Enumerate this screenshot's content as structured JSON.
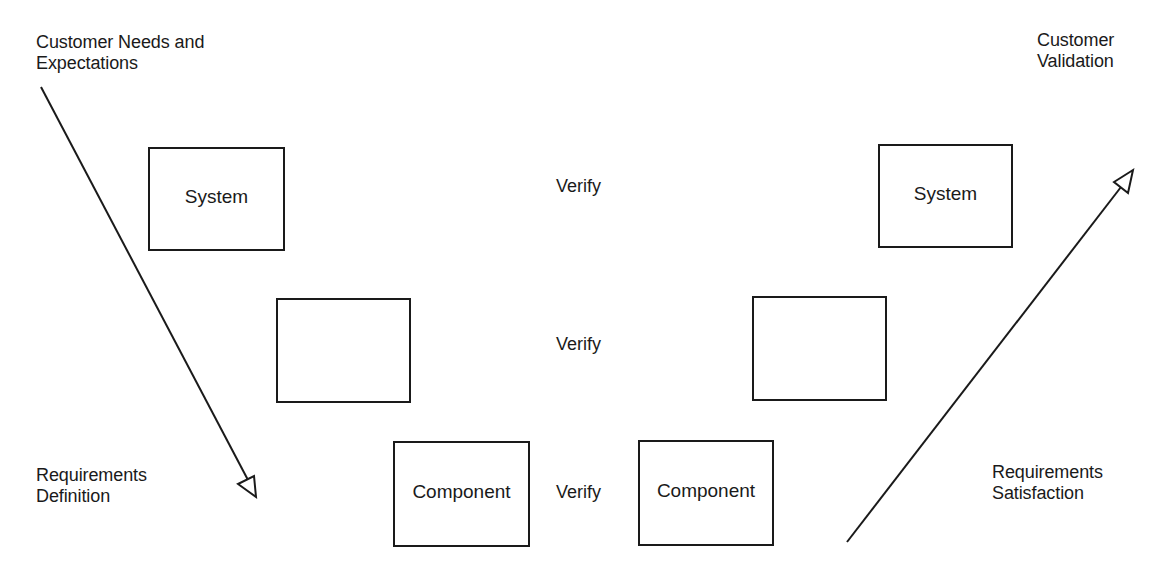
{
  "diagram": {
    "type": "V-model",
    "left_side": {
      "top_label": [
        "Customer Needs and",
        "Expectations"
      ],
      "bottom_label": [
        "Requirements",
        "Definition"
      ],
      "arrow_direction": "down-right",
      "boxes": [
        {
          "label": "System"
        },
        {
          "label": ""
        },
        {
          "label": "Component"
        }
      ]
    },
    "right_side": {
      "top_label": [
        "Customer",
        "Validation"
      ],
      "bottom_label": [
        "Requirements",
        "Satisfaction"
      ],
      "arrow_direction": "up-right",
      "boxes": [
        {
          "label": "System"
        },
        {
          "label": ""
        },
        {
          "label": "Component"
        }
      ]
    },
    "verify_labels": [
      "Verify",
      "Verify",
      "Verify"
    ],
    "colors": {
      "stroke": "#1a1a1a",
      "background": "#ffffff"
    }
  }
}
